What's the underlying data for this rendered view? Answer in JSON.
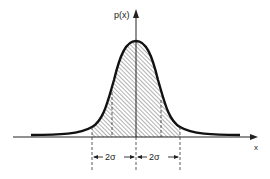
{
  "diagram": {
    "y_axis_label": "p(x)",
    "x_axis_label": "x",
    "left_interval_label": "2σ",
    "right_interval_label": "2σ",
    "colors": {
      "curve": "#111111",
      "axis": "#222222",
      "hatch": "#555555",
      "background": "#ffffff"
    }
  }
}
